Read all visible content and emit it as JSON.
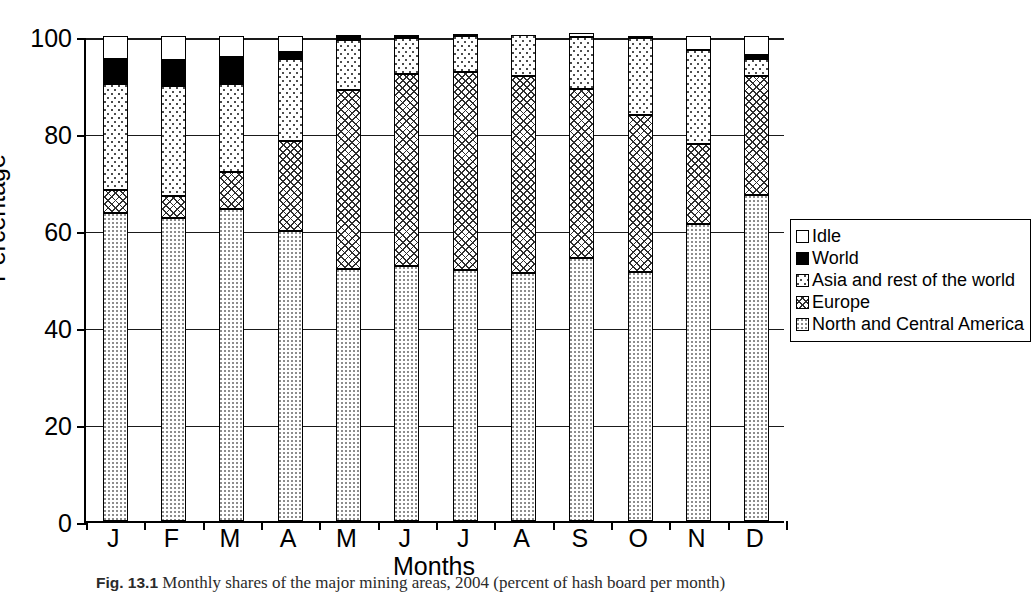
{
  "chart_data": {
    "type": "bar",
    "subtype": "stacked-bar-100-percent",
    "title": "",
    "xlabel": "Months",
    "ylabel": "Percentage",
    "ylim": [
      0,
      100
    ],
    "yticks": [
      0,
      20,
      40,
      60,
      80,
      100
    ],
    "grid": true,
    "legend_position": "right",
    "categories": [
      "J",
      "F",
      "M",
      "A",
      "M",
      "J",
      "J",
      "A",
      "S",
      "O",
      "N",
      "D"
    ],
    "category_names": [
      "January",
      "February",
      "March",
      "April",
      "May",
      "June",
      "July",
      "August",
      "September",
      "October",
      "November",
      "December"
    ],
    "stack_order_bottom_to_top": [
      "North and Central America",
      "Europe",
      "Asia and rest of the world",
      "World",
      "Idle"
    ],
    "series": [
      {
        "name": "North and Central America",
        "pattern": "fine-dot",
        "values": [
          63.5,
          62.5,
          64.3,
          59.8,
          52.0,
          52.6,
          51.8,
          51.1,
          54.2,
          51.3,
          61.3,
          67.2
        ]
      },
      {
        "name": "Europe",
        "pattern": "cross-hatch",
        "values": [
          4.7,
          4.6,
          7.6,
          18.6,
          36.9,
          39.5,
          40.8,
          40.7,
          34.8,
          32.4,
          16.5,
          24.5
        ]
      },
      {
        "name": "Asia and rest of the world",
        "pattern": "coarse-dot",
        "values": [
          22.0,
          22.6,
          18.3,
          16.9,
          10.2,
          7.4,
          7.4,
          8.4,
          10.7,
          15.9,
          19.4,
          3.5
        ]
      },
      {
        "name": "World",
        "pattern": "solid-black",
        "values": [
          5.1,
          5.3,
          5.4,
          1.5,
          1.1,
          0.4,
          0.3,
          0.0,
          0.0,
          0.4,
          0.0,
          0.8
        ]
      },
      {
        "name": "Idle",
        "pattern": "empty-white",
        "values": [
          4.7,
          5.0,
          4.4,
          3.2,
          0.0,
          0.1,
          0.0,
          0.0,
          1.0,
          0.0,
          2.8,
          4.0
        ]
      }
    ],
    "cumulative_tops": {
      "note": "running totals bottom-to-top per category, percent",
      "north_and_central_america": [
        63.5,
        62.5,
        64.3,
        59.8,
        52.0,
        52.6,
        51.8,
        51.1,
        54.2,
        51.3,
        61.3,
        67.2
      ],
      "europe": [
        68.2,
        67.1,
        71.9,
        78.4,
        88.9,
        92.1,
        92.6,
        91.8,
        89.0,
        83.7,
        77.8,
        91.7
      ],
      "asia_and_rest_of_the_world": [
        90.2,
        89.7,
        90.2,
        95.3,
        99.1,
        99.5,
        100.0,
        100.2,
        99.7,
        99.6,
        97.2,
        95.2
      ],
      "world": [
        95.3,
        95.0,
        95.6,
        96.8,
        100.2,
        99.9,
        100.3,
        100.2,
        99.7,
        100.0,
        97.2,
        96.0
      ],
      "idle": [
        100.0,
        100.0,
        100.0,
        100.0,
        100.0,
        100.0,
        100.0,
        100.0,
        100.0,
        100.0,
        100.0,
        100.0
      ]
    }
  },
  "axes": {
    "y_title": "Percentage",
    "x_title": "Months",
    "y_tick_labels": [
      "0",
      "20",
      "40",
      "60",
      "80",
      "100"
    ],
    "x_tick_labels": [
      "J",
      "F",
      "M",
      "A",
      "M",
      "J",
      "J",
      "A",
      "S",
      "O",
      "N",
      "D"
    ]
  },
  "legend": {
    "items": [
      {
        "label": "Idle",
        "pattern": "empty-white"
      },
      {
        "label": "World",
        "pattern": "solid-black"
      },
      {
        "label": "Asia and rest of the world",
        "pattern": "coarse-dot"
      },
      {
        "label": "Europe",
        "pattern": "cross-hatch"
      },
      {
        "label": "North and Central America",
        "pattern": "fine-dot"
      }
    ]
  },
  "caption": {
    "figure_number": "Fig. 13.1",
    "text": "Monthly shares of the major mining areas, 2004 (percent of hash board per month)"
  }
}
